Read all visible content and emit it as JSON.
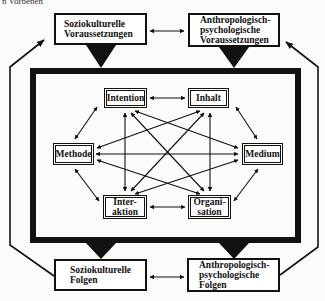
{
  "caption_fragment": "n Vorbenen",
  "outer_boxes": {
    "top_left": {
      "lines": [
        "Soziokulturelle",
        "Voraussetzungen"
      ]
    },
    "top_right": {
      "lines": [
        "Anthropologisch-",
        "psychologische",
        "Voraussetzungen"
      ]
    },
    "bottom_left": {
      "lines": [
        "Soziokulturelle",
        "Folgen"
      ]
    },
    "bottom_right": {
      "lines": [
        "Anthropologisch-",
        "psychologische",
        "Folgen"
      ]
    }
  },
  "inner_boxes": {
    "intention": {
      "lines": [
        "Intention"
      ]
    },
    "inhalt": {
      "lines": [
        "Inhalt"
      ]
    },
    "methode": {
      "lines": [
        "Methode"
      ]
    },
    "medium": {
      "lines": [
        "Medium"
      ]
    },
    "interaktion": {
      "lines": [
        "Inter-",
        "aktion"
      ]
    },
    "organisation": {
      "lines": [
        "Organi-",
        "sation"
      ]
    }
  },
  "colors": {
    "ink": "#111111",
    "paper": "#fbfbf9"
  }
}
